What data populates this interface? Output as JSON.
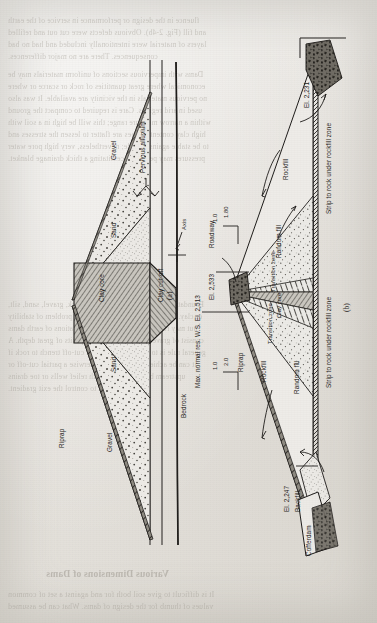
{
  "figure": {
    "caption_a": "(a)",
    "caption_b": "(b)",
    "orientation": "rotated-90-ccw-on-page",
    "medium": "scanned book page, sideways figure"
  },
  "diagram_a": {
    "name": "Zoned earthfill dam on pervious alluvium",
    "labels": {
      "axis": "Axis",
      "pervious_alluvium": "Pervious alluvium",
      "bedrock": "Bedrock",
      "clay_core": "Clay core",
      "clay_cutoff": "Clay cut-off",
      "sand_upstream": "Sand",
      "gravel_upstream": "Gravel",
      "sand_downstream": "Sand",
      "gravel_downstream": "Gravel",
      "riprap": "Riprap"
    }
  },
  "diagram_b": {
    "name": "Zoned rockfill dam section with elevations",
    "labels": {
      "roadway": "Roadway",
      "rockfill_upper": "Rockfill",
      "rockfill_lower": "Rockfill",
      "random_fill_upper": "Random fill",
      "random_fill_lower": "Random fill",
      "transition_zone_upper": "Transition zone",
      "transition_zone_lower": "Transition zone",
      "clay_core": "Clay core",
      "riprap": "Riprap",
      "backfill": "Backfill",
      "cofferdam": "Cofferdam",
      "strip_note_upper": "Strip to rock under rockfill zone",
      "strip_note_lower": "Strip to rock under rockfill zone"
    },
    "elevations": {
      "crest": "El. 2,533",
      "max_reservoir": "Max. normal res. W.S. El. 2,513",
      "downstream_toe": "El. 2,231",
      "upstream_toe": "El. 2,247"
    },
    "slopes": {
      "downstream_h": "1.80",
      "downstream_v": "1.0",
      "upstream_h": "2.0",
      "upstream_v": "1.0"
    }
  },
  "bleed_text": {
    "top": [
      "fluence in the design or performance in service of the earth",
      "and fill (Fig. 2-4b). Obvious defects were cut out and refilled",
      "layers of material were intentionally included and had no bad",
      "consequences. There are no major differences."
    ],
    "upper_mid": [
      "Dams with impervious sections of uniform materials may be",
      "economical where great quantities of rock or scarce or where",
      "no pervious materials in the vicinity are available. It was also",
      "used in arid regions. Care is required to compact the ground",
      "within a narrow moisture range; this will be high in a soil with",
      "high clay content. Slopes are flatter to lessen the stresses and",
      "to be stable against a slide; nevertheless, very high pore water",
      "pressures may persist, necessitating a thick drainage blanket."
    ],
    "lower_mid": [
      "Foundations of earth dams may be of rock, gravel, sand, silt,",
      "or clay. Rock and coarse gravel pose no problem of stability",
      "but may require grouting. Many foundations of earth dams",
      "consist of gravel and sand alluvial deposits of great depth. A",
      "general rule is to construct a positive cut-off trench to rock if",
      "it can be achieved in the dry; otherwise a partial cut-off or",
      "upstream blanket is used with relief wells or toe drains",
      "downstream to control the exit gradient."
    ],
    "bottom": [
      "Various Dimensions of Dams",
      "It is difficult to give soil both for and against a set of common",
      "values of thumb for the design of dams. What can be assumed"
    ]
  }
}
